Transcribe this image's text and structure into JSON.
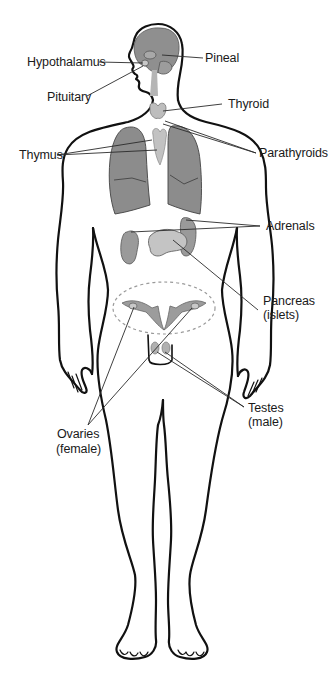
{
  "diagram": {
    "colors": {
      "outline": "#111111",
      "organ_fill": "#8a8a8a",
      "gland_fill": "#b8b8b8",
      "leader_line": "#2a2a2a",
      "dashed_circle": "#9a9a9a",
      "background": "#ffffff"
    },
    "labels": {
      "hypothalamus": "Hypothalamus",
      "pineal": "Pineal",
      "pituitary": "Pituitary",
      "thyroid": "Thyroid",
      "thymus": "Thymus",
      "parathyroids": "Parathyroids",
      "adrenals": "Adrenals",
      "pancreas_line1": "Pancreas",
      "pancreas_line2": "(islets)",
      "testes_line1": "Testes",
      "testes_line2": "(male)",
      "ovaries_line1": "Ovaries",
      "ovaries_line2": "(female)"
    }
  }
}
